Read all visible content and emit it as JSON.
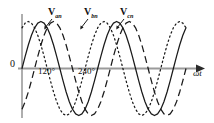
{
  "figure": {
    "background_color": "#ffffff",
    "axis_color": "#8d8d8d",
    "curve_color": "#1a1a1a",
    "width": 214,
    "height": 123
  },
  "labels": {
    "origin": "0",
    "x_axis": "ωt",
    "phase_a_name": "V",
    "phase_a_sub": "an",
    "phase_b_name": "V",
    "phase_b_sub": "bn",
    "phase_c_name": "V",
    "phase_c_sub": "cn",
    "tick_120": "120°",
    "tick_240": "240°"
  },
  "chart_data": {
    "type": "line",
    "title": "",
    "xlabel": "ωt",
    "ylabel": "",
    "xlim": [
      -20,
      820
    ],
    "ylim": [
      -1.15,
      1.15
    ],
    "grid": false,
    "legend": "inline-annotations",
    "x_tick_labels": [
      "120°",
      "240°"
    ],
    "x_tick_values": [
      120,
      240
    ],
    "y_tick_labels": [
      "0"
    ],
    "y_tick_values": [
      0
    ],
    "amplitude": 1.0,
    "period_degrees": 360,
    "series": [
      {
        "name": "V_an",
        "label": "Van",
        "phase_deg": 0,
        "style": "solid",
        "color": "#1a1a1a",
        "x": [
          0,
          15,
          30,
          45,
          60,
          75,
          90,
          105,
          120,
          135,
          150,
          165,
          180,
          195,
          210,
          225,
          240,
          255,
          270,
          285,
          300,
          315,
          330,
          345,
          360,
          375,
          390,
          405,
          420,
          435,
          450,
          465,
          480,
          495,
          510,
          525,
          540,
          555,
          570,
          585,
          600,
          615,
          630,
          645,
          660,
          675,
          690,
          705,
          720,
          735,
          750,
          765,
          780
        ],
        "y": [
          0.0,
          0.259,
          0.5,
          0.707,
          0.866,
          0.966,
          1.0,
          0.966,
          0.866,
          0.707,
          0.5,
          0.259,
          0.0,
          -0.259,
          -0.5,
          -0.707,
          -0.866,
          -0.966,
          -1.0,
          -0.966,
          -0.866,
          -0.707,
          -0.5,
          -0.259,
          0.0,
          0.259,
          0.5,
          0.707,
          0.866,
          0.966,
          1.0,
          0.966,
          0.866,
          0.707,
          0.5,
          0.259,
          0.0,
          -0.259,
          -0.5,
          -0.707,
          -0.866,
          -0.966,
          -1.0,
          -0.966,
          -0.866,
          -0.707,
          -0.5,
          -0.259,
          0.0,
          0.259,
          0.5,
          0.707,
          0.866
        ]
      },
      {
        "name": "V_bn",
        "label": "Vbn",
        "phase_deg": -120,
        "style": "dashed",
        "color": "#1a1a1a",
        "x": [
          0,
          15,
          30,
          45,
          60,
          75,
          90,
          105,
          120,
          135,
          150,
          165,
          180,
          195,
          210,
          225,
          240,
          255,
          270,
          285,
          300,
          315,
          330,
          345,
          360,
          375,
          390,
          405,
          420,
          435,
          450,
          465,
          480,
          495,
          510,
          525,
          540,
          555,
          570,
          585,
          600,
          615,
          630,
          645,
          660,
          675,
          690,
          705,
          720,
          735,
          750,
          765,
          780
        ],
        "y": [
          -0.866,
          -0.707,
          -0.5,
          -0.259,
          0.0,
          0.259,
          0.5,
          0.707,
          0.866,
          0.966,
          1.0,
          0.966,
          0.866,
          0.707,
          0.5,
          0.259,
          0.0,
          -0.259,
          -0.5,
          -0.707,
          -0.866,
          -0.966,
          -1.0,
          -0.966,
          -0.866,
          -0.707,
          -0.5,
          -0.259,
          0.0,
          0.259,
          0.5,
          0.707,
          0.866,
          0.966,
          1.0,
          0.966,
          0.866,
          0.707,
          0.5,
          0.259,
          0.0,
          -0.259,
          -0.5,
          -0.707,
          -0.866,
          -0.966,
          -1.0,
          -0.966,
          -0.866,
          -0.707,
          -0.5,
          -0.259,
          0.0
        ]
      },
      {
        "name": "V_cn",
        "label": "Vcn",
        "phase_deg": -240,
        "style": "dotted",
        "color": "#1a1a1a",
        "x": [
          0,
          15,
          30,
          45,
          60,
          75,
          90,
          105,
          120,
          135,
          150,
          165,
          180,
          195,
          210,
          225,
          240,
          255,
          270,
          285,
          300,
          315,
          330,
          345,
          360,
          375,
          390,
          405,
          420,
          435,
          450,
          465,
          480,
          495,
          510,
          525,
          540,
          555,
          570,
          585,
          600,
          615,
          630,
          645,
          660,
          675,
          690,
          705,
          720,
          735,
          750,
          765,
          780
        ],
        "y": [
          0.866,
          0.966,
          1.0,
          0.966,
          0.866,
          0.707,
          0.5,
          0.259,
          0.0,
          -0.259,
          -0.5,
          -0.707,
          -0.866,
          -0.966,
          -1.0,
          -0.966,
          -0.866,
          -0.707,
          -0.5,
          -0.259,
          0.0,
          0.259,
          0.5,
          0.707,
          0.866,
          0.966,
          1.0,
          0.966,
          0.866,
          0.707,
          0.5,
          0.259,
          0.0,
          -0.259,
          -0.5,
          -0.707,
          -0.866,
          -0.966,
          -1.0,
          -0.966,
          -0.866,
          -0.707,
          -0.5,
          -0.259,
          0.0,
          0.259,
          0.5,
          0.707,
          0.866,
          0.966,
          1.0,
          0.966,
          0.866
        ]
      }
    ],
    "annotations": [
      {
        "text": "Van",
        "points_to_series": "V_an"
      },
      {
        "text": "Vbn",
        "points_to_series": "V_bn"
      },
      {
        "text": "Vcn",
        "points_to_series": "V_cn"
      }
    ]
  }
}
